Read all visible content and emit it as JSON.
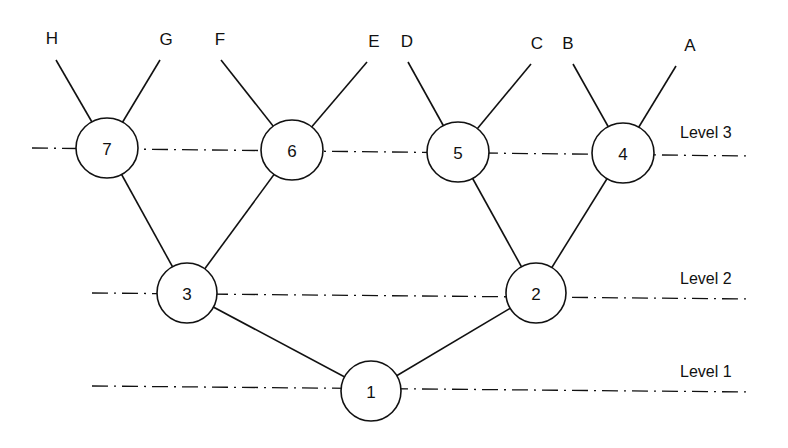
{
  "diagram": {
    "type": "binary-tree",
    "levels": [
      {
        "label": "Level 3",
        "line": {
          "x1": 32,
          "y1": 148,
          "x2": 750,
          "y2": 156
        },
        "label_pos": {
          "x": 680,
          "y": 138
        }
      },
      {
        "label": "Level 2",
        "line": {
          "x1": 92,
          "y1": 293,
          "x2": 752,
          "y2": 299
        },
        "label_pos": {
          "x": 680,
          "y": 284
        }
      },
      {
        "label": "Level 1",
        "line": {
          "x1": 92,
          "y1": 386,
          "x2": 752,
          "y2": 392
        },
        "label_pos": {
          "x": 680,
          "y": 377
        }
      }
    ],
    "nodes": [
      {
        "id": "1",
        "label": "1",
        "cx": 371,
        "cy": 391,
        "rx": 30,
        "ry": 30
      },
      {
        "id": "2",
        "label": "2",
        "cx": 536,
        "cy": 293,
        "rx": 30,
        "ry": 30
      },
      {
        "id": "3",
        "label": "3",
        "cx": 187,
        "cy": 293,
        "rx": 30,
        "ry": 30
      },
      {
        "id": "4",
        "label": "4",
        "cx": 623,
        "cy": 153,
        "rx": 31,
        "ry": 30
      },
      {
        "id": "5",
        "label": "5",
        "cx": 458,
        "cy": 152,
        "rx": 31,
        "ry": 30
      },
      {
        "id": "6",
        "label": "6",
        "cx": 292,
        "cy": 150,
        "rx": 31,
        "ry": 30
      },
      {
        "id": "7",
        "label": "7",
        "cx": 107,
        "cy": 148,
        "rx": 31,
        "ry": 30
      }
    ],
    "leaves": [
      {
        "label": "H",
        "x": 52,
        "y": 44,
        "line_x": 56,
        "line_y": 60
      },
      {
        "label": "G",
        "x": 166,
        "y": 45,
        "line_x": 160,
        "line_y": 60
      },
      {
        "label": "F",
        "x": 220,
        "y": 45,
        "line_x": 221,
        "line_y": 60
      },
      {
        "label": "E",
        "x": 374,
        "y": 47,
        "line_x": 367,
        "line_y": 62
      },
      {
        "label": "D",
        "x": 407,
        "y": 47,
        "line_x": 408,
        "line_y": 62
      },
      {
        "label": "C",
        "x": 537,
        "y": 49,
        "line_x": 531,
        "line_y": 64
      },
      {
        "label": "B",
        "x": 568,
        "y": 49,
        "line_x": 573,
        "line_y": 64
      },
      {
        "label": "A",
        "x": 690,
        "y": 51,
        "line_x": 676,
        "line_y": 66
      }
    ],
    "edges": [
      {
        "from": "1",
        "to": "3"
      },
      {
        "from": "1",
        "to": "2"
      },
      {
        "from": "3",
        "to": "7"
      },
      {
        "from": "3",
        "to": "6"
      },
      {
        "from": "2",
        "to": "5"
      },
      {
        "from": "2",
        "to": "4"
      },
      {
        "from": "7",
        "to": "H"
      },
      {
        "from": "7",
        "to": "G"
      },
      {
        "from": "6",
        "to": "F"
      },
      {
        "from": "6",
        "to": "E"
      },
      {
        "from": "5",
        "to": "D"
      },
      {
        "from": "5",
        "to": "C"
      },
      {
        "from": "4",
        "to": "B"
      },
      {
        "from": "4",
        "to": "A"
      }
    ]
  }
}
